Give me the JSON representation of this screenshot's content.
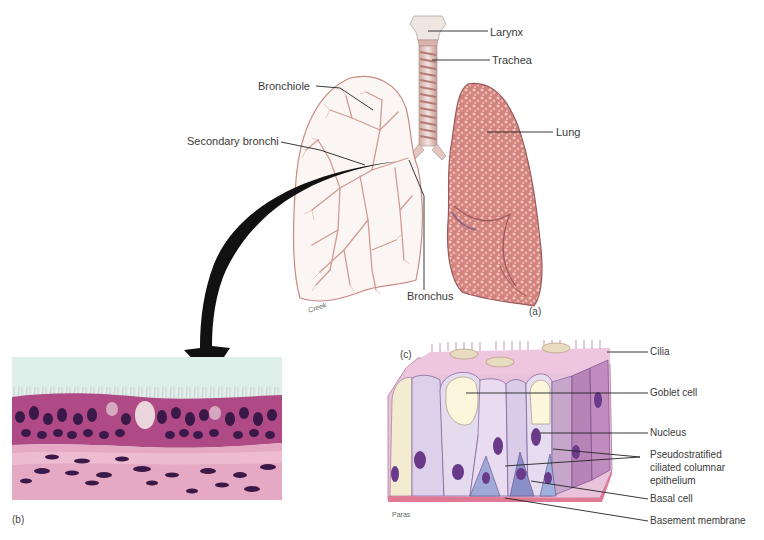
{
  "figure": {
    "panels": [
      {
        "id": "a",
        "label": "(a)",
        "caption": "Respiratory tract overview"
      },
      {
        "id": "b",
        "label": "(b)",
        "caption": "Micrograph of tracheal epithelium"
      },
      {
        "id": "c",
        "label": "(c)",
        "caption": "Pseudostratified ciliated columnar epithelium drawing"
      }
    ],
    "panel_a": {
      "labels": {
        "larynx": "Larynx",
        "trachea": "Trachea",
        "bronchiole": "Bronchiole",
        "secondary_bronchi": "Secondary bronchi",
        "lung": "Lung",
        "bronchus": "Bronchus"
      },
      "artist": "Creek",
      "letter": "(a)"
    },
    "panel_b": {
      "letter": "(b)"
    },
    "panel_c": {
      "letter": "(c)",
      "artist": "Paras",
      "labels": {
        "cilia": "Cilia",
        "goblet_cell": "Goblet cell",
        "nucleus": "Nucleus",
        "pseudo_line1": "Pseudostratified",
        "pseudo_line2": "ciliated columnar",
        "pseudo_line3": "epithelium",
        "basal_cell": "Basal cell",
        "basement_membrane": "Basement membrane"
      }
    },
    "colors": {
      "lung_fill": "#d88a86",
      "lung_outline_sketch": "#c98a84",
      "arrow": "#111111",
      "micro_bg": "#dff0ea",
      "epithelium": "#b04a86",
      "nuclei": "#3a1848",
      "connective": "#e6a9c4",
      "cell_violet": "#c7b4dc",
      "cell_pink": "#e8b4d2"
    }
  }
}
